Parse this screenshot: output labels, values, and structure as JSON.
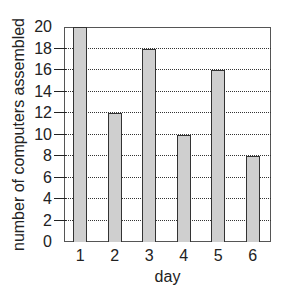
{
  "chart_data": {
    "type": "bar",
    "title": "",
    "xlabel": "day",
    "ylabel": "number of computers assembled",
    "categories": [
      "1",
      "2",
      "3",
      "4",
      "5",
      "6"
    ],
    "values": [
      20,
      12,
      18,
      10,
      16,
      8
    ],
    "ylim": [
      0,
      20
    ],
    "yticks": [
      0,
      2,
      4,
      6,
      8,
      10,
      12,
      14,
      16,
      18,
      20
    ],
    "grid": {
      "y": true,
      "style": "dotted"
    },
    "legend": null,
    "bar_color": "#cfcfcf",
    "edge_color": "#333333"
  }
}
